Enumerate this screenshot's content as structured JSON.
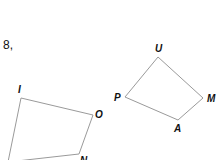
{
  "problem": {
    "number_label": "8,"
  },
  "figures": [
    {
      "name": "quadrilateral-ION",
      "vertices": [
        {
          "label": "I",
          "x": 21,
          "y": 98,
          "lx": 18,
          "ly": 93
        },
        {
          "label": "O",
          "x": 93,
          "y": 115,
          "lx": 95,
          "ly": 118
        },
        {
          "label": "N",
          "x": 79,
          "y": 154,
          "lx": 80,
          "ly": 164
        },
        {
          "label": "",
          "x": 8,
          "y": 162,
          "lx": 0,
          "ly": 0
        }
      ]
    },
    {
      "name": "quadrilateral-UMAP",
      "vertices": [
        {
          "label": "U",
          "x": 158,
          "y": 57,
          "lx": 155,
          "ly": 52
        },
        {
          "label": "M",
          "x": 203,
          "y": 98,
          "lx": 207,
          "ly": 102
        },
        {
          "label": "A",
          "x": 178,
          "y": 120,
          "lx": 174,
          "ly": 132
        },
        {
          "label": "P",
          "x": 125,
          "y": 97,
          "lx": 114,
          "ly": 101
        }
      ]
    }
  ],
  "colors": {
    "edge": "#9a9a9a",
    "text": "#111111"
  }
}
